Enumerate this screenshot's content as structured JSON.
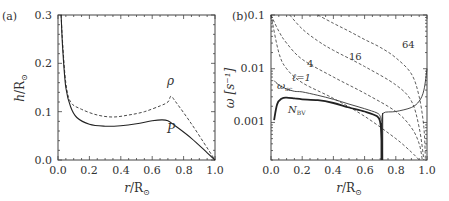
{
  "chart_data": [
    {
      "panel": "(a)",
      "type": "line",
      "xlabel": "r/R⊙",
      "ylabel": "h/R⊙",
      "xlim": [
        0.0,
        1.0
      ],
      "ylim": [
        0.0,
        0.3
      ],
      "xticks": [
        "0.0",
        "0.2",
        "0.4",
        "0.6",
        "0.8",
        "1.0"
      ],
      "yticks": [
        "0.0",
        "0.1",
        "0.2",
        "0.3"
      ],
      "grid": false,
      "series": [
        {
          "name": "ρ",
          "style": "dashed",
          "x": [
            0.02,
            0.03,
            0.05,
            0.08,
            0.15,
            0.25,
            0.35,
            0.45,
            0.55,
            0.65,
            0.7,
            0.72,
            0.75,
            0.85,
            0.95,
            1.0
          ],
          "y": [
            0.3,
            0.24,
            0.16,
            0.12,
            0.105,
            0.093,
            0.089,
            0.093,
            0.1,
            0.112,
            0.12,
            0.132,
            0.12,
            0.075,
            0.025,
            0.0
          ]
        },
        {
          "name": "P",
          "style": "solid",
          "x": [
            0.02,
            0.03,
            0.05,
            0.08,
            0.12,
            0.2,
            0.3,
            0.4,
            0.5,
            0.6,
            0.66,
            0.7,
            0.75,
            0.85,
            0.95,
            1.0
          ],
          "y": [
            0.3,
            0.23,
            0.15,
            0.11,
            0.088,
            0.074,
            0.07,
            0.071,
            0.075,
            0.081,
            0.083,
            0.081,
            0.07,
            0.045,
            0.015,
            0.0
          ]
        }
      ],
      "annotations": [
        {
          "text": "ρ",
          "x": 0.7,
          "y": 0.145
        },
        {
          "text": "P",
          "x": 0.7,
          "y": 0.058
        }
      ]
    },
    {
      "panel": "(b)",
      "type": "line",
      "xlabel": "r/R⊙",
      "ylabel": "ω [s⁻¹]",
      "yscale": "log",
      "xlim": [
        0.0,
        1.0
      ],
      "ylim": [
        0.0002,
        0.1
      ],
      "xticks": [
        "0.0",
        "0.2",
        "0.4",
        "0.6",
        "0.8",
        "1.0"
      ],
      "yticks": [
        "0.001",
        "0.01",
        "0.1"
      ],
      "grid": false,
      "series": [
        {
          "name": "ℓ=1",
          "style": "dashed",
          "x": [
            0.0,
            0.05,
            0.1,
            0.2,
            0.4,
            0.6,
            0.8,
            0.9,
            0.95
          ],
          "y": [
            0.1,
            0.02,
            0.01,
            0.0055,
            0.0028,
            0.0013,
            0.0005,
            0.00028,
            0.0002
          ]
        },
        {
          "name": "4",
          "style": "dashed",
          "x": [
            0.0,
            0.05,
            0.1,
            0.2,
            0.4,
            0.6,
            0.8,
            0.9,
            0.95,
            0.97
          ],
          "y": [
            0.1,
            0.05,
            0.03,
            0.015,
            0.007,
            0.0035,
            0.0016,
            0.0008,
            0.0004,
            0.0002
          ]
        },
        {
          "name": "16",
          "style": "dashed",
          "x": [
            0.12,
            0.2,
            0.3,
            0.4,
            0.6,
            0.8,
            0.9,
            0.95,
            0.98
          ],
          "y": [
            0.1,
            0.055,
            0.033,
            0.022,
            0.011,
            0.005,
            0.0025,
            0.0008,
            0.0002
          ]
        },
        {
          "name": "64",
          "style": "dashed",
          "x": [
            0.3,
            0.4,
            0.5,
            0.6,
            0.7,
            0.8,
            0.9,
            0.95,
            0.98,
            0.99
          ],
          "y": [
            0.1,
            0.07,
            0.05,
            0.035,
            0.025,
            0.016,
            0.008,
            0.003,
            0.0008,
            0.0002
          ]
        },
        {
          "name": "ωac",
          "style": "solid",
          "x": [
            0.02,
            0.05,
            0.1,
            0.15,
            0.2,
            0.3,
            0.4,
            0.5,
            0.6,
            0.68,
            0.7,
            0.713,
            0.72,
            0.8,
            0.9,
            0.95,
            0.98,
            1.0
          ],
          "y": [
            0.006,
            0.005,
            0.0042,
            0.0038,
            0.0037,
            0.0032,
            0.0027,
            0.0022,
            0.0018,
            0.0015,
            0.0013,
            0.001,
            0.0015,
            0.0016,
            0.0019,
            0.0025,
            0.004,
            0.01
          ]
        },
        {
          "name": "N_BV",
          "style": "solid-thick",
          "x": [
            0.02,
            0.04,
            0.07,
            0.1,
            0.15,
            0.2,
            0.3,
            0.4,
            0.5,
            0.6,
            0.68,
            0.7,
            0.71,
            0.713
          ],
          "y": [
            0.0011,
            0.0022,
            0.0028,
            0.0029,
            0.0028,
            0.0027,
            0.0026,
            0.0023,
            0.0019,
            0.0016,
            0.0013,
            0.001,
            0.0005,
            0.0002
          ]
        }
      ],
      "annotations": [
        {
          "text": "64",
          "x": 0.83,
          "y": 0.028
        },
        {
          "text": "16",
          "x": 0.53,
          "y": 0.018
        },
        {
          "text": "4",
          "x": 0.3,
          "y": 0.012
        },
        {
          "text": "ℓ=1",
          "x": 0.18,
          "y": 0.0065
        },
        {
          "text": "ωac",
          "x": 0.08,
          "y": 0.0048
        },
        {
          "text": "N_BV",
          "x": 0.12,
          "y": 0.0021
        }
      ]
    }
  ],
  "panels": {
    "a": {
      "tag": "(a)",
      "xlabel_main": "r/R",
      "ylabel_main": "h/R",
      "xticks": [
        "0.0",
        "0.2",
        "0.4",
        "0.6",
        "0.8",
        "1.0"
      ],
      "yticks": [
        "0.0",
        "0.1",
        "0.2",
        "0.3"
      ],
      "label_rho": "ρ",
      "label_p": "P"
    },
    "b": {
      "tag": "(b)",
      "xlabel_main": "r/R",
      "ylabel_main": "ω [s⁻¹]",
      "xticks": [
        "0.0",
        "0.2",
        "0.4",
        "0.6",
        "0.8",
        "1.0"
      ],
      "yticks": [
        "0.1",
        "0.01",
        "0.001"
      ],
      "label_64": "64",
      "label_16": "16",
      "label_4": "4",
      "label_l1": "ℓ=1",
      "label_wac": "ω",
      "label_wac_sub": "ac",
      "label_nbv": "N",
      "label_nbv_sub": "BV"
    },
    "sun_symbol": "⊙"
  }
}
